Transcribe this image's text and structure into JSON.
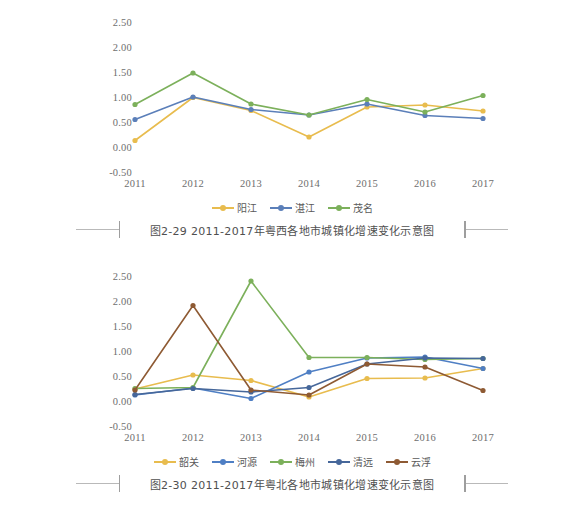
{
  "figures": [
    {
      "id": "fig-2-29",
      "caption": "图2-29   2011-2017年粤西各地市城镇化增速变化示意图",
      "chart_data": {
        "type": "line",
        "title": "",
        "xlabel": "",
        "ylabel": "",
        "x": [
          "2011",
          "2012",
          "2013",
          "2014",
          "2015",
          "2016",
          "2017"
        ],
        "ytick_labels": [
          "2.50",
          "2.00",
          "1.50",
          "1.00",
          "0.50",
          "0.00",
          "-0.50"
        ],
        "yticks": [
          2.5,
          2.0,
          1.5,
          1.0,
          0.5,
          0.0,
          -0.5
        ],
        "ylim": [
          -0.5,
          2.5
        ],
        "grid": false,
        "legend_position": "bottom",
        "series": [
          {
            "name": "阳江",
            "color": "#e8bc4e",
            "values": [
              0.13,
              0.99,
              0.73,
              0.2,
              0.8,
              0.84,
              0.72
            ]
          },
          {
            "name": "湛江",
            "color": "#5b7fb9",
            "values": [
              0.55,
              1.0,
              0.75,
              0.64,
              0.86,
              0.63,
              0.57
            ]
          },
          {
            "name": "茂名",
            "color": "#7cb05b",
            "values": [
              0.85,
              1.48,
              0.86,
              0.64,
              0.95,
              0.7,
              1.03
            ]
          }
        ]
      }
    },
    {
      "id": "fig-2-30",
      "caption": "图2-30   2011-2017年粤北各地市城镇化增速变化示意图",
      "chart_data": {
        "type": "line",
        "title": "",
        "xlabel": "",
        "ylabel": "",
        "x": [
          "2011",
          "2012",
          "2013",
          "2014",
          "2015",
          "2016",
          "2017"
        ],
        "ytick_labels": [
          "2.50",
          "2.00",
          "1.50",
          "1.00",
          "0.50",
          "0.00",
          "-0.50"
        ],
        "yticks": [
          2.5,
          2.0,
          1.5,
          1.0,
          0.5,
          0.0,
          -0.5
        ],
        "ylim": [
          -0.5,
          2.5
        ],
        "grid": false,
        "legend_position": "bottom",
        "series": [
          {
            "name": "韶关",
            "color": "#e8bc4e",
            "values": [
              0.24,
              0.52,
              0.41,
              0.08,
              0.45,
              0.46,
              0.65
            ]
          },
          {
            "name": "河源",
            "color": "#4f7fc4",
            "values": [
              0.12,
              0.26,
              0.05,
              0.58,
              0.86,
              0.88,
              0.65
            ]
          },
          {
            "name": "梅州",
            "color": "#7cb05b",
            "values": [
              0.25,
              0.27,
              2.4,
              0.87,
              0.87,
              0.83,
              0.85
            ]
          },
          {
            "name": "清远",
            "color": "#46679a",
            "values": [
              0.13,
              0.25,
              0.18,
              0.27,
              0.74,
              0.86,
              0.85
            ]
          },
          {
            "name": "云浮",
            "color": "#8e5a33",
            "values": [
              0.22,
              1.91,
              0.22,
              0.12,
              0.74,
              0.68,
              0.21
            ]
          }
        ]
      }
    }
  ]
}
